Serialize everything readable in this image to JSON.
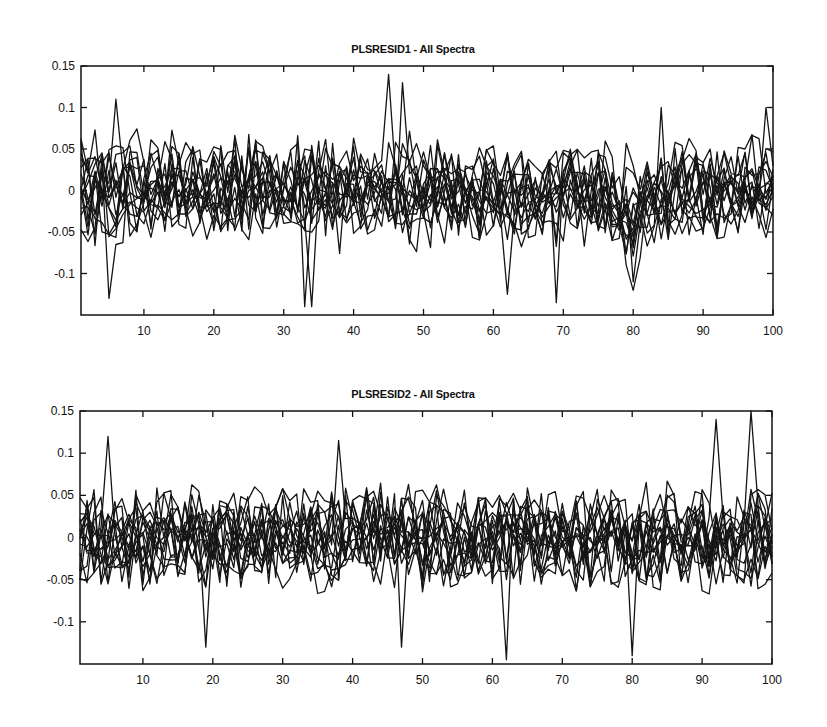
{
  "chart_data": [
    {
      "type": "line",
      "title": "PLSRESID1 - All Spectra",
      "xlabel": "",
      "ylabel": "",
      "xlim": [
        1,
        100
      ],
      "ylim": [
        -0.15,
        0.15
      ],
      "x_ticks": [
        10,
        20,
        30,
        40,
        50,
        60,
        70,
        80,
        90,
        100
      ],
      "y_ticks": [
        0.15,
        0.1,
        0.05,
        0,
        -0.05,
        -0.1
      ],
      "y_tick_labels": [
        "0.15",
        "0.1",
        "0.05",
        "0",
        "-0.05",
        "-0.1"
      ],
      "grid": false,
      "legend": null,
      "n_series_approx": 16,
      "x": "1..100 (variable index)",
      "noise_amplitude": 0.045,
      "notable_points": [
        {
          "x": 5,
          "y": -0.13
        },
        {
          "x": 6,
          "y": 0.11
        },
        {
          "x": 33,
          "y": -0.14
        },
        {
          "x": 34,
          "y": -0.14
        },
        {
          "x": 45,
          "y": 0.14
        },
        {
          "x": 47,
          "y": 0.13
        },
        {
          "x": 62,
          "y": -0.125
        },
        {
          "x": 69,
          "y": -0.135
        },
        {
          "x": 80,
          "y": -0.11
        },
        {
          "x": 84,
          "y": 0.1
        },
        {
          "x": 99,
          "y": 0.1
        }
      ],
      "description": "Many overlapping residual spectra oscillating around 0, mostly within ±0.1, with a dip near x≈80."
    },
    {
      "type": "line",
      "title": "PLSRESID2 - All Spectra",
      "xlabel": "",
      "ylabel": "",
      "xlim": [
        1,
        100
      ],
      "ylim": [
        -0.15,
        0.15
      ],
      "x_ticks": [
        10,
        20,
        30,
        40,
        50,
        60,
        70,
        80,
        90,
        100
      ],
      "y_ticks": [
        0.15,
        0.1,
        0.05,
        0,
        -0.05,
        -0.1
      ],
      "y_tick_labels": [
        "0.15",
        "0.1",
        "0.05",
        "0",
        "-0.05",
        "-0.1"
      ],
      "grid": false,
      "legend": null,
      "n_series_approx": 16,
      "x": "1..100 (variable index)",
      "noise_amplitude": 0.045,
      "notable_points": [
        {
          "x": 5,
          "y": 0.12
        },
        {
          "x": 19,
          "y": -0.13
        },
        {
          "x": 38,
          "y": 0.115
        },
        {
          "x": 47,
          "y": -0.13
        },
        {
          "x": 62,
          "y": -0.145
        },
        {
          "x": 80,
          "y": -0.14
        },
        {
          "x": 92,
          "y": 0.14
        },
        {
          "x": 97,
          "y": 0.15
        }
      ],
      "description": "Many overlapping residual spectra oscillating around 0, mostly within ±0.1, with larger spikes near x≈92–97."
    }
  ],
  "charts": [
    {
      "title": "PLSRESID1 - All Spectra"
    },
    {
      "title": "PLSRESID2 - All Spectra"
    }
  ]
}
